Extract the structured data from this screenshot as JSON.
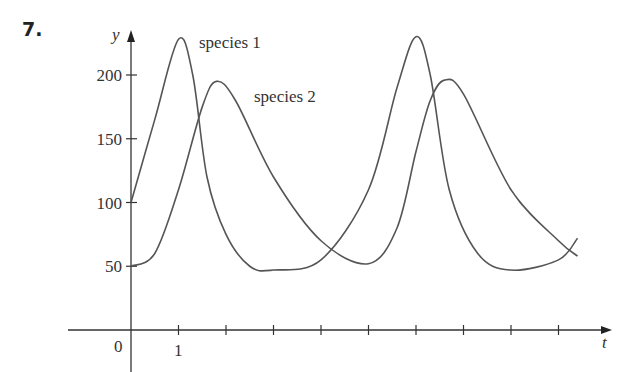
{
  "problem_number": "7.",
  "chart_data": {
    "type": "line",
    "title": "",
    "xlabel": "t",
    "ylabel": "y",
    "x_ticks": [
      0,
      1,
      2,
      3,
      4,
      5,
      6,
      7,
      8,
      9
    ],
    "x_tick_labels": [
      "0",
      "1"
    ],
    "y_ticks": [
      50,
      100,
      150,
      200
    ],
    "y_tick_labels": [
      "50",
      "100",
      "150",
      "200"
    ],
    "grid": false,
    "series": [
      {
        "name": "species 1",
        "points": [
          [
            0,
            100
          ],
          [
            0.5,
            165
          ],
          [
            1,
            228
          ],
          [
            1.3,
            200
          ],
          [
            1.6,
            120
          ],
          [
            2,
            75
          ],
          [
            2.5,
            50
          ],
          [
            3,
            47
          ],
          [
            4,
            55
          ],
          [
            5,
            110
          ],
          [
            5.6,
            190
          ],
          [
            6,
            230
          ],
          [
            6.3,
            200
          ],
          [
            6.7,
            110
          ],
          [
            7.3,
            60
          ],
          [
            8,
            47
          ],
          [
            9,
            55
          ],
          [
            9.4,
            72
          ]
        ]
      },
      {
        "name": "species 2",
        "points": [
          [
            0,
            50
          ],
          [
            0.5,
            60
          ],
          [
            1,
            110
          ],
          [
            1.5,
            175
          ],
          [
            1.8,
            195
          ],
          [
            2.2,
            180
          ],
          [
            3,
            120
          ],
          [
            4,
            70
          ],
          [
            5,
            52
          ],
          [
            5.6,
            80
          ],
          [
            6,
            140
          ],
          [
            6.3,
            180
          ],
          [
            6.6,
            196
          ],
          [
            7,
            185
          ],
          [
            8,
            110
          ],
          [
            9,
            70
          ],
          [
            9.4,
            58
          ]
        ]
      }
    ],
    "annotations": [
      {
        "text": "species 1"
      },
      {
        "text": "species 2"
      }
    ]
  }
}
